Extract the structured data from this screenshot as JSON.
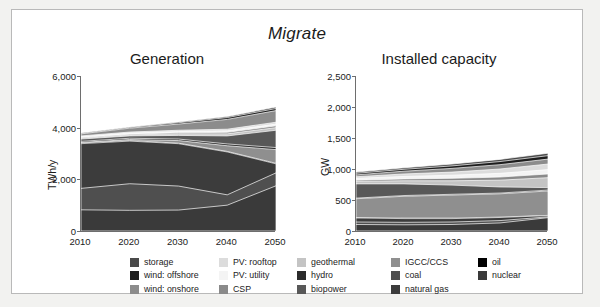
{
  "figure": {
    "title": "Migrate",
    "frame_color": "#b9b9b9",
    "background": "#ffffff",
    "page_background": "#f2f2f0"
  },
  "legend": {
    "columns": [
      {
        "left": 118,
        "items": [
          {
            "label": "storage",
            "color": "#4a4a4a"
          },
          {
            "label": "wind: offshore",
            "color": "#1d1d1d"
          },
          {
            "label": "wind: onshore",
            "color": "#8c8c8c"
          }
        ]
      },
      {
        "left": 207,
        "items": [
          {
            "label": "PV: rooftop",
            "color": "#dcdcdc"
          },
          {
            "label": "PV: utility",
            "color": "#f4f4f4"
          },
          {
            "label": "CSP",
            "color": "#8a8a8a"
          }
        ]
      },
      {
        "left": 285,
        "items": [
          {
            "label": "geothermal",
            "color": "#c4c4c4"
          },
          {
            "label": "hydro",
            "color": "#2b2b2b"
          },
          {
            "label": "biopower",
            "color": "#585858"
          }
        ]
      },
      {
        "left": 379,
        "items": [
          {
            "label": "IGCC/CCS",
            "color": "#8f8f8f"
          },
          {
            "label": "coal",
            "color": "#4f4f4f"
          },
          {
            "label": "natural gas",
            "color": "#3c3c3c"
          }
        ]
      },
      {
        "left": 466,
        "items": [
          {
            "label": "oil",
            "color": "#000000"
          },
          {
            "label": "nuclear",
            "color": "#3a3a3a"
          }
        ]
      }
    ]
  },
  "chart_data": [
    {
      "type": "area",
      "id": "generation",
      "title": "Generation",
      "xlabel": "",
      "ylabel": "TWh/y",
      "x": [
        2010,
        2020,
        2030,
        2040,
        2050
      ],
      "xticks": [
        "2010",
        "2020",
        "2030",
        "2040",
        "2050"
      ],
      "xlim": [
        2010,
        2050
      ],
      "ylim": [
        0,
        6000
      ],
      "yticks": [
        0,
        2000,
        4000,
        6000
      ],
      "ytick_labels": [
        "0",
        "2,000",
        "4,000",
        "6,000"
      ],
      "grid": false,
      "legend_position": "bottom",
      "stack_order_bottom_to_top": [
        "nuclear",
        "coal",
        "natural gas",
        "oil",
        "IGCC/CCS",
        "hydro",
        "biopower",
        "geothermal",
        "CSP",
        "PV: utility",
        "PV: rooftop",
        "wind: onshore",
        "wind: offshore",
        "storage"
      ],
      "series": [
        {
          "name": "nuclear",
          "color": "#3a3a3a",
          "values": [
            820,
            800,
            810,
            1000,
            1750
          ]
        },
        {
          "name": "coal",
          "color": "#4f4f4f",
          "values": [
            1650,
            1830,
            1740,
            1400,
            2250
          ]
        },
        {
          "name": "natural gas",
          "color": "#3c3c3c",
          "values": [
            3380,
            3480,
            3380,
            3060,
            2600
          ]
        },
        {
          "name": "oil",
          "color": "#000000",
          "values": [
            3410,
            3500,
            3400,
            3080,
            2620
          ]
        },
        {
          "name": "IGCC/CCS",
          "color": "#8f8f8f",
          "values": [
            3430,
            3540,
            3500,
            3300,
            3150
          ]
        },
        {
          "name": "hydro",
          "color": "#2b2b2b",
          "values": [
            3470,
            3590,
            3560,
            3370,
            3230
          ]
        },
        {
          "name": "biopower",
          "color": "#585858",
          "values": [
            3560,
            3680,
            3700,
            3680,
            3900
          ]
        },
        {
          "name": "geothermal",
          "color": "#c4c4c4",
          "values": [
            3600,
            3720,
            3760,
            3760,
            4000
          ]
        },
        {
          "name": "CSP",
          "color": "#8a8a8a",
          "values": [
            3620,
            3750,
            3800,
            3820,
            4070
          ]
        },
        {
          "name": "PV: utility",
          "color": "#f4f4f4",
          "values": [
            3650,
            3790,
            3850,
            3880,
            4140
          ]
        },
        {
          "name": "PV: rooftop",
          "color": "#dcdcdc",
          "values": [
            3680,
            3830,
            3900,
            3940,
            4210
          ]
        },
        {
          "name": "wind: onshore",
          "color": "#8c8c8c",
          "values": [
            3760,
            3980,
            4140,
            4320,
            4660
          ]
        },
        {
          "name": "wind: offshore",
          "color": "#1d1d1d",
          "values": [
            3780,
            4010,
            4190,
            4390,
            4740
          ]
        },
        {
          "name": "storage",
          "color": "#4a4a4a",
          "values": [
            3790,
            4030,
            4220,
            4430,
            4800
          ]
        }
      ]
    },
    {
      "type": "area",
      "id": "installed_capacity",
      "title": "Installed capacity",
      "xlabel": "",
      "ylabel": "GW",
      "x": [
        2010,
        2020,
        2030,
        2040,
        2050
      ],
      "xticks": [
        "2010",
        "2020",
        "2030",
        "2040",
        "2050"
      ],
      "xlim": [
        2010,
        2050
      ],
      "ylim": [
        0,
        2500
      ],
      "yticks": [
        0,
        500,
        1000,
        1500,
        2000,
        2500
      ],
      "ytick_labels": [
        "0",
        "500",
        "1,000",
        "1,500",
        "2,000",
        "2,500"
      ],
      "grid": false,
      "legend_position": "bottom",
      "stack_order_bottom_to_top": [
        "nuclear",
        "coal",
        "natural gas",
        "oil",
        "IGCC/CCS",
        "hydro",
        "biopower",
        "geothermal",
        "CSP",
        "PV: utility",
        "PV: rooftop",
        "wind: onshore",
        "wind: offshore",
        "storage"
      ],
      "series": [
        {
          "name": "nuclear",
          "color": "#3a3a3a",
          "values": [
            105,
            100,
            105,
            130,
            215
          ]
        },
        {
          "name": "coal",
          "color": "#4f4f4f",
          "values": [
            145,
            140,
            145,
            168,
            228
          ]
        },
        {
          "name": "natural gas",
          "color": "#3c3c3c",
          "values": [
            210,
            200,
            200,
            218,
            248
          ]
        },
        {
          "name": "oil",
          "color": "#000000",
          "values": [
            218,
            208,
            208,
            224,
            252
          ]
        },
        {
          "name": "IGCC/CCS",
          "color": "#8f8f8f",
          "values": [
            520,
            560,
            580,
            600,
            645
          ]
        },
        {
          "name": "hydro",
          "color": "#2b2b2b",
          "values": [
            530,
            572,
            592,
            612,
            660
          ]
        },
        {
          "name": "biopower",
          "color": "#585858",
          "values": [
            760,
            760,
            740,
            710,
            700
          ]
        },
        {
          "name": "geothermal",
          "color": "#c4c4c4",
          "values": [
            800,
            810,
            810,
            820,
            860
          ]
        },
        {
          "name": "CSP",
          "color": "#8a8a8a",
          "values": [
            820,
            840,
            850,
            870,
            920
          ]
        },
        {
          "name": "PV: utility",
          "color": "#f4f4f4",
          "values": [
            850,
            880,
            900,
            930,
            990
          ]
        },
        {
          "name": "PV: rooftop",
          "color": "#dcdcdc",
          "values": [
            875,
            920,
            950,
            1000,
            1080
          ]
        },
        {
          "name": "wind: onshore",
          "color": "#8c8c8c",
          "values": [
            905,
            965,
            1010,
            1070,
            1160
          ]
        },
        {
          "name": "wind: offshore",
          "color": "#1d1d1d",
          "values": [
            930,
            995,
            1050,
            1120,
            1215
          ]
        },
        {
          "name": "storage",
          "color": "#4a4a4a",
          "values": [
            950,
            1020,
            1080,
            1155,
            1255
          ]
        }
      ]
    }
  ]
}
